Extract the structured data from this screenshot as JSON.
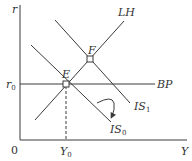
{
  "diagram": {
    "axes": {
      "y_label": "r",
      "x_label": "Y",
      "origin_label": "0",
      "r0_label": "r",
      "r0_sub": "0",
      "y0_label": "Y",
      "y0_sub": "0"
    },
    "curves": {
      "lh": "LH",
      "bp": "BP",
      "is1": "IS",
      "is1_sub": "1",
      "is0": "IS",
      "is0_sub": "0"
    },
    "points": {
      "e": "E",
      "f": "F"
    },
    "colors": {
      "line": "#3a3a3a",
      "text": "#333333",
      "background": "#ffffff"
    }
  }
}
